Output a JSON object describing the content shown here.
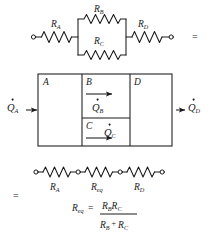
{
  "figure": {
    "sections": {
      "top": {
        "name": "series-parallel-resistor-network",
        "equals_sign": "=",
        "resistors": [
          {
            "id": "RA",
            "label": "R",
            "subscript": "A",
            "position": "series-left"
          },
          {
            "id": "RB",
            "label": "R",
            "subscript": "B",
            "position": "parallel-upper"
          },
          {
            "id": "RC",
            "label": "R",
            "subscript": "C",
            "position": "parallel-lower"
          },
          {
            "id": "RD",
            "label": "R",
            "subscript": "D",
            "position": "series-right"
          }
        ]
      },
      "middle": {
        "name": "wall-section-heat-flow",
        "regions": [
          {
            "id": "A",
            "label": "A"
          },
          {
            "id": "B",
            "label": "B"
          },
          {
            "id": "C",
            "label": "C"
          },
          {
            "id": "D",
            "label": "D"
          }
        ],
        "heat_flows": [
          {
            "id": "QA",
            "label": "Q",
            "subscript": "A",
            "dot": true,
            "direction": "right",
            "location": "inlet-left"
          },
          {
            "id": "QB",
            "label": "Q",
            "subscript": "B",
            "dot": true,
            "direction": "right",
            "location": "region-B"
          },
          {
            "id": "QC",
            "label": "Q",
            "subscript": "C",
            "dot": true,
            "direction": "right",
            "location": "region-C"
          },
          {
            "id": "QD",
            "label": "Q",
            "subscript": "D",
            "dot": true,
            "direction": "right",
            "location": "outlet-right"
          }
        ]
      },
      "bottom": {
        "name": "equivalent-series-resistor-network",
        "equals_sign": "=",
        "resistors": [
          {
            "id": "RA",
            "label": "R",
            "subscript": "A"
          },
          {
            "id": "Req",
            "label": "R",
            "subscript": "eq"
          },
          {
            "id": "RD",
            "label": "R",
            "subscript": "D"
          }
        ],
        "formula": {
          "lhs": "R",
          "lhs_sub": "eq",
          "equals": "=",
          "numerator": [
            {
              "label": "R",
              "subscript": "B"
            },
            {
              "label": "R",
              "subscript": "C"
            }
          ],
          "denominator": [
            {
              "label": "R",
              "subscript": "B"
            },
            {
              "op": "+"
            },
            {
              "label": "R",
              "subscript": "C"
            }
          ],
          "text": "R_eq = R_B R_C / (R_B + R_C)"
        }
      }
    },
    "colors": {
      "ink": "#1a1a1a",
      "background": "#ffffff"
    }
  }
}
